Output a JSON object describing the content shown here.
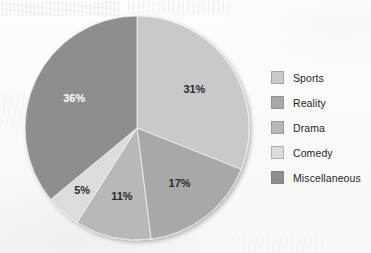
{
  "chart_data": {
    "type": "pie",
    "title": "",
    "categories": [
      "Sports",
      "Reality",
      "Drama",
      "Comedy",
      "Miscellaneous"
    ],
    "values": [
      31,
      17,
      11,
      5,
      36
    ],
    "value_labels": [
      "31%",
      "17%",
      "11%",
      "5%",
      "36%"
    ],
    "units": "percent",
    "start_angle_deg": 0,
    "direction": "clockwise",
    "legend_position": "right",
    "grid": false,
    "colors": [
      "#c9c9c9",
      "#a8a8a8",
      "#b8b8b8",
      "#dcdcdc",
      "#8e8e8e"
    ],
    "label_text_colors": [
      "#2b2b2b",
      "#2b2b2b",
      "#2b2b2b",
      "#2b2b2b",
      "#ffffff"
    ],
    "slices": [
      {
        "label": "Sports",
        "value": 31,
        "display": "31%",
        "color": "#c9c9c9",
        "text_color": "#2b2b2b"
      },
      {
        "label": "Reality",
        "value": 17,
        "display": "17%",
        "color": "#a8a8a8",
        "text_color": "#2b2b2b"
      },
      {
        "label": "Drama",
        "value": 11,
        "display": "11%",
        "color": "#b8b8b8",
        "text_color": "#2b2b2b"
      },
      {
        "label": "Comedy",
        "value": 5,
        "display": "5%",
        "color": "#dcdcdc",
        "text_color": "#2b2b2b"
      },
      {
        "label": "Miscellaneous",
        "value": 36,
        "display": "36%",
        "color": "#8e8e8e",
        "text_color": "#ffffff"
      }
    ]
  },
  "legend": {
    "items": [
      {
        "label": "Sports",
        "color": "#c9c9c9"
      },
      {
        "label": "Reality",
        "color": "#a8a8a8"
      },
      {
        "label": "Drama",
        "color": "#b8b8b8"
      },
      {
        "label": "Comedy",
        "color": "#dcdcdc"
      },
      {
        "label": "Miscellaneous",
        "color": "#8e8e8e"
      }
    ]
  }
}
